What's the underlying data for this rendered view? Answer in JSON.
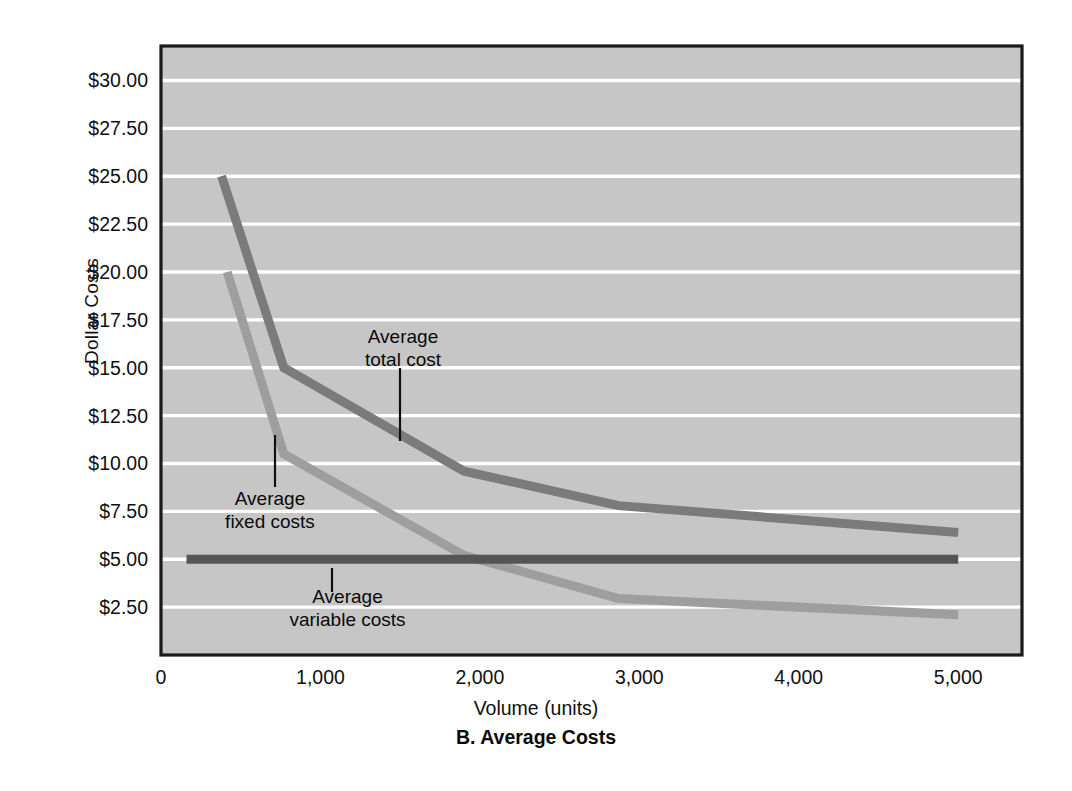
{
  "chart_data": {
    "type": "line",
    "title": "B. Average Costs",
    "xlabel": "Volume (units)",
    "ylabel": "Dollar Costs",
    "xlim": [
      0,
      5400
    ],
    "ylim": [
      0,
      31.8
    ],
    "grid": true,
    "legend_position": "inline-annotations",
    "xticks": [
      "0",
      "1,000",
      "2,000",
      "3,000",
      "4,000",
      "5,000"
    ],
    "xtick_values": [
      0,
      1000,
      2000,
      3000,
      4000,
      5000
    ],
    "yticks": [
      "$2.50",
      "$5.00",
      "$7.50",
      "$10.00",
      "$12.50",
      "$15.00",
      "$17.50",
      "$20.00",
      "$22.50",
      "$25.00",
      "$27.50",
      "$30.00"
    ],
    "ytick_values": [
      2.5,
      5.0,
      7.5,
      10.0,
      12.5,
      15.0,
      17.5,
      20.0,
      22.5,
      25.0,
      27.5,
      30.0
    ],
    "series": [
      {
        "name": "Average total cost",
        "color": "#7b7b7b",
        "x": [
          380,
          770,
          1900,
          2870,
          5000
        ],
        "y": [
          25.0,
          15.0,
          9.6,
          7.8,
          6.4
        ]
      },
      {
        "name": "Average fixed costs",
        "color": "#9e9e9e",
        "x": [
          415,
          770,
          1900,
          2870,
          5000
        ],
        "y": [
          20.0,
          10.5,
          5.2,
          2.95,
          2.1
        ]
      },
      {
        "name": "Average variable costs",
        "color": "#555555",
        "x": [
          160,
          5000
        ],
        "y": [
          5.0,
          5.0
        ]
      }
    ],
    "annotations": [
      {
        "name": "Average total cost",
        "text": "Average\ntotal cost"
      },
      {
        "name": "Average fixed costs",
        "text": "Average\nfixed costs"
      },
      {
        "name": "Average variable costs",
        "text": "Average\nvariable costs"
      }
    ]
  },
  "figure": {
    "plot_background": "#c6c6c6",
    "gridline_color": "#ffffff",
    "frame_color": "#1a1a1a",
    "page_background": "#ffffff"
  }
}
